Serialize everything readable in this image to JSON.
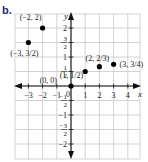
{
  "part_label": "b.",
  "chart_data": {
    "type": "scatter",
    "title": "",
    "xlabel": "x",
    "ylabel": "y",
    "xlim": [
      -4,
      5
    ],
    "ylim": [
      -2.5,
      2.5
    ],
    "grid": true,
    "x_ticks": [
      {
        "value": -3,
        "label": "−3"
      },
      {
        "value": -2,
        "label": "−2"
      },
      {
        "value": -1,
        "label": "−1"
      },
      {
        "value": 1,
        "label": "1"
      },
      {
        "value": 2,
        "label": "2"
      },
      {
        "value": 3,
        "label": "3"
      },
      {
        "value": 4,
        "label": "4"
      }
    ],
    "y_ticks": [
      {
        "value": 2,
        "num": "2",
        "den": ""
      },
      {
        "value": 1.5,
        "num": "3",
        "den": "2"
      },
      {
        "value": 1,
        "num": "1",
        "den": ""
      },
      {
        "value": 0.5,
        "num": "1",
        "den": "2"
      },
      {
        "value": -0.5,
        "num": "−1",
        "den": "2"
      },
      {
        "value": -1,
        "num": "−1",
        "den": ""
      },
      {
        "value": -1.5,
        "num": "−3",
        "den": "2"
      },
      {
        "value": -2,
        "num": "−2",
        "den": ""
      }
    ],
    "origin_label": "0",
    "points": [
      {
        "x": -2,
        "y": 2,
        "label": "(−2, 2)"
      },
      {
        "x": -3,
        "y": 1.5,
        "label": "(−3, 3/2)"
      },
      {
        "x": 0,
        "y": 0,
        "label": "(0, 0)"
      },
      {
        "x": 1,
        "y": 0.5,
        "label": "(1, 1/2)"
      },
      {
        "x": 2,
        "y": 0.6667,
        "label": "(2, 2/3)"
      },
      {
        "x": 3,
        "y": 0.75,
        "label": "(3, 3/4)"
      }
    ],
    "colors": {
      "grid": "#c8c8c8",
      "axis": "#111111",
      "point": "#000000"
    }
  }
}
